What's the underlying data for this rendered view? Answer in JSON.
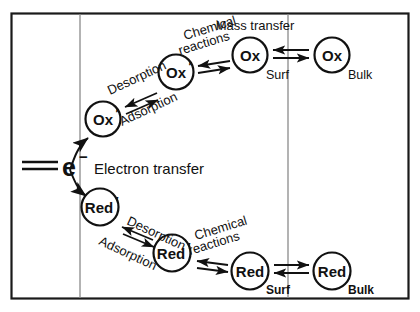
{
  "figure": {
    "type": "electrochemical-reaction-pathway-diagram",
    "frame": {
      "border_color": "#1a1a1a"
    },
    "regions": [
      {
        "name": "electrode",
        "label": ""
      },
      {
        "name": "adsorbed-layer",
        "label": ""
      },
      {
        "name": "diffusion-layer",
        "label": ""
      },
      {
        "name": "bulk-solution",
        "label": ""
      }
    ],
    "electron_transfer": {
      "species_symbol": "e",
      "species_charge": "−",
      "label": "Electron transfer"
    },
    "nodes": [
      {
        "id": "ox-adsorbed",
        "label": "Ox",
        "prime": "′",
        "sub": ""
      },
      {
        "id": "ox-desorbed",
        "label": "Ox",
        "prime": "′",
        "sub": ""
      },
      {
        "id": "ox-surf",
        "label": "Ox",
        "prime": "",
        "sub": "Surf"
      },
      {
        "id": "ox-bulk",
        "label": "Ox",
        "prime": "",
        "sub": "Bulk"
      },
      {
        "id": "red-adsorbed",
        "label": "Red",
        "prime": "′",
        "sub": ""
      },
      {
        "id": "red-desorbed",
        "label": "Red",
        "prime": "′",
        "sub": ""
      },
      {
        "id": "red-surf",
        "label": "Red",
        "prime": "",
        "sub": "Surf"
      },
      {
        "id": "red-bulk",
        "label": "Red",
        "prime": "",
        "sub": "Bulk"
      }
    ],
    "process_labels": {
      "desorption_top": "Desorption",
      "adsorption_top": "Adsorption",
      "chemical_top_line1": "Chemical",
      "chemical_top_line2": "reactions",
      "mass_transfer_top": "Mass transfer",
      "desorption_bottom": "Desorption",
      "adsorption_bottom": "Adsorption",
      "chemical_bottom_line1": "Chemical",
      "chemical_bottom_line2": "reactions"
    },
    "subscripts": {
      "ox_surf": "Surf",
      "ox_bulk": "Bulk",
      "red_surf": "Surf",
      "red_bulk": "Bulk"
    }
  }
}
